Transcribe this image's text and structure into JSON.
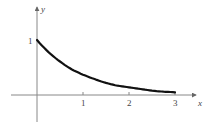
{
  "chart_data": {
    "type": "line",
    "title": "",
    "xlabel": "x",
    "ylabel": "y",
    "function": "y = e^(-x)",
    "xlim": [
      -0.55,
      3.45
    ],
    "ylim": [
      -0.5,
      1.6
    ],
    "x_ticks": [
      "1",
      "2",
      "3"
    ],
    "y_ticks": [
      "1"
    ],
    "grid": false,
    "legend": null,
    "series": [
      {
        "name": "curve",
        "x": [
          0,
          0.25,
          0.5,
          0.75,
          1.0,
          1.25,
          1.5,
          1.75,
          2.0,
          2.25,
          2.5,
          2.75,
          3.0
        ],
        "y": [
          1.0,
          0.78,
          0.61,
          0.47,
          0.37,
          0.29,
          0.22,
          0.17,
          0.14,
          0.11,
          0.08,
          0.06,
          0.05
        ]
      }
    ],
    "colors": {
      "curve": "#111111",
      "axes": "#777777"
    }
  },
  "labels": {
    "x_axis": "x",
    "y_axis": "y",
    "tick_x1": "1",
    "tick_x2": "2",
    "tick_x3": "3",
    "tick_y1": "1"
  }
}
